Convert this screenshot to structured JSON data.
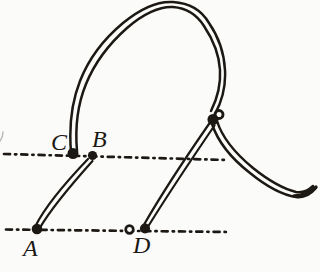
{
  "diagram": {
    "paper_color": "#fbfbf9",
    "ink_color": "#1c1814",
    "labels": {
      "A": "A",
      "B": "B",
      "C": "C",
      "D": "D"
    }
  }
}
